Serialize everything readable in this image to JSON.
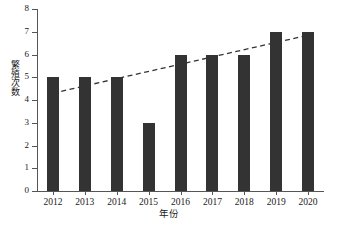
{
  "chart_data": {
    "type": "bar",
    "title": "",
    "subtitle": "",
    "xlabel": "年份",
    "ylabel": "繁殖次数",
    "categories": [
      "2012",
      "2013",
      "2014",
      "2015",
      "2016",
      "2017",
      "2018",
      "2019",
      "2020"
    ],
    "values": [
      5,
      5,
      5,
      3,
      6,
      6,
      6,
      7,
      7
    ],
    "series": [
      {
        "name": "繁殖次数",
        "type": "bar",
        "values": [
          5,
          5,
          5,
          3,
          6,
          6,
          6,
          7,
          7
        ],
        "color": "#333333"
      },
      {
        "name": "趋势线",
        "type": "line",
        "style": "dashed",
        "color": "#333333",
        "x": [
          "2012",
          "2020"
        ],
        "values": [
          4.3,
          6.85
        ]
      }
    ],
    "ylim": [
      0,
      8
    ],
    "yticks": [
      0,
      1,
      2,
      3,
      4,
      5,
      6,
      7,
      8
    ],
    "ytick_labels": [
      "0",
      "1",
      "2",
      "3",
      "4",
      "5",
      "6",
      "7",
      "8"
    ],
    "xtick_labels": [
      "2012",
      "2013",
      "2014",
      "2015",
      "2016",
      "2017",
      "2018",
      "2019",
      "2020"
    ],
    "grid": false,
    "legend": "none",
    "background_color": "#ffffff",
    "axis_color": "#555555",
    "bar_color": "#333333",
    "trendline_color": "#333333"
  }
}
